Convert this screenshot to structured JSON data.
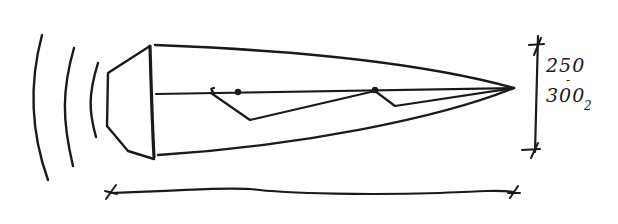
{
  "diagram": {
    "type": "hand-drawn sketch",
    "ink_color": "#1a1a1a",
    "background": "#ffffff",
    "dimension_label": {
      "top_value": "250",
      "separator": "-",
      "bottom_value": "300",
      "suffix": "2"
    }
  }
}
